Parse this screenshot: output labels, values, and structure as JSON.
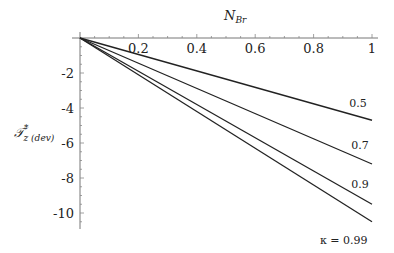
{
  "chart_data": {
    "type": "line",
    "title": "",
    "xlabel": "N_Br",
    "ylabel": "T*_z (dev)",
    "xlim": [
      0,
      1
    ],
    "ylim": [
      -10.8,
      0
    ],
    "grid": false,
    "legend_position": "inline labels at right end of curves",
    "x_ticks": [
      0.2,
      0.4,
      0.6,
      0.8,
      1
    ],
    "x_tick_labels": [
      "0.2",
      "0.4",
      "0.6",
      "0.8",
      "1"
    ],
    "y_ticks": [
      -2,
      -4,
      -6,
      -8,
      -10
    ],
    "y_tick_labels": [
      "-2",
      "-4",
      "-6",
      "-8",
      "-10"
    ],
    "x": [
      0,
      1
    ],
    "series": [
      {
        "name": "0.5",
        "label": "0.5",
        "values": [
          0,
          -4.7
        ]
      },
      {
        "name": "0.7",
        "label": "0.7",
        "values": [
          0,
          -7.2
        ]
      },
      {
        "name": "0.9",
        "label": "0.9",
        "values": [
          0,
          -9.5
        ]
      },
      {
        "name": "0.99",
        "label": "κ = 0.99",
        "values": [
          0,
          -10.5
        ]
      }
    ],
    "annotations": [
      "κ = 0.99"
    ]
  },
  "labels": {
    "x_axis_main": "N",
    "x_axis_sub": "Br",
    "y_axis_main": "𝒯",
    "y_axis_sup": "*",
    "y_axis_sub": "z (dev)"
  }
}
